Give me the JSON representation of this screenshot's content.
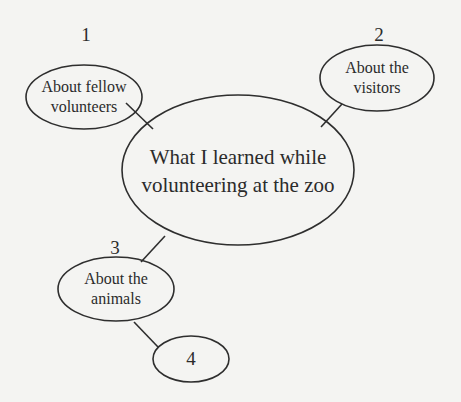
{
  "diagram": {
    "type": "mind-map",
    "colors": {
      "background": "#f4f4f2",
      "stroke": "#2e2e2e",
      "text": "#2b2b2b"
    },
    "center": {
      "line1": "What I learned while",
      "line2": "volunteering at the zoo"
    },
    "nodes": [
      {
        "number": "1",
        "line1": "About fellow",
        "line2": "volunteers"
      },
      {
        "number": "2",
        "line1": "About the",
        "line2": "visitors"
      },
      {
        "number": "3",
        "line1": "About the",
        "line2": "animals"
      },
      {
        "number": "",
        "line1": "4",
        "line2": ""
      }
    ],
    "edges": [
      {
        "from": "node-1",
        "to": "center"
      },
      {
        "from": "node-2",
        "to": "center"
      },
      {
        "from": "center",
        "to": "node-3"
      },
      {
        "from": "node-3",
        "to": "node-4"
      }
    ]
  }
}
